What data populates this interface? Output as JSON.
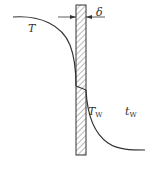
{
  "diagram": {
    "type": "wall temperature profile",
    "labels": {
      "fluid_temp": "T",
      "wall_thickness": "δ",
      "wall_temp_main": "T",
      "wall_temp_sub": "W",
      "coolant_temp_main": "t",
      "coolant_temp_sub": "W"
    },
    "colors": {
      "line": "#333333",
      "hatch": "#555555",
      "background": "#ffffff"
    }
  }
}
